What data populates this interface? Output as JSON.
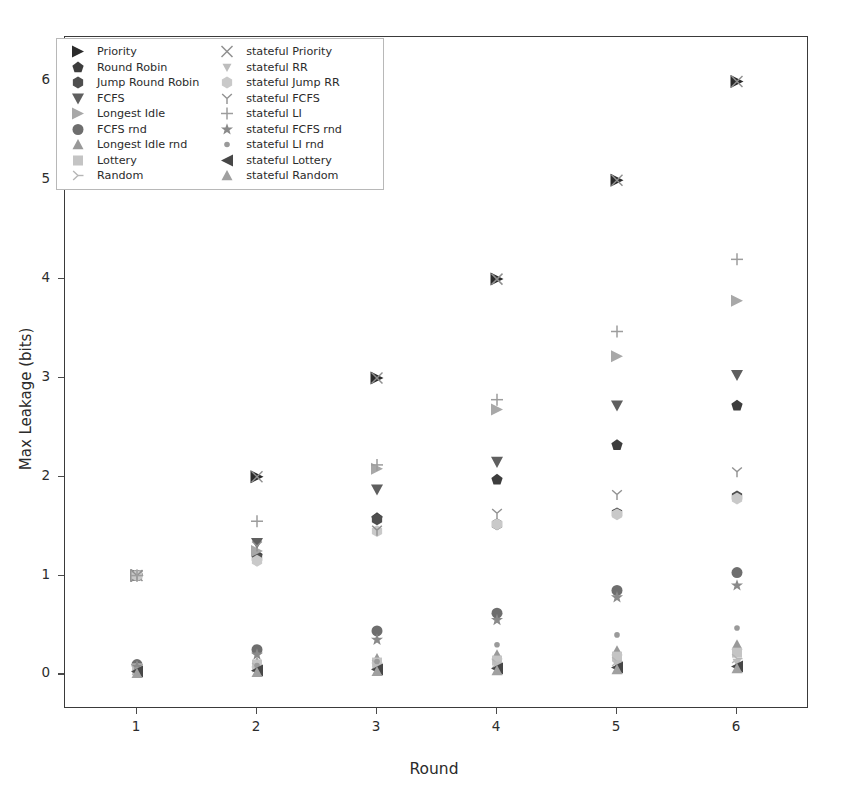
{
  "chart_data": {
    "type": "scatter",
    "title": "",
    "xlabel": "Round",
    "ylabel": "Max Leakage (bits)",
    "xlim": [
      0.4,
      6.6
    ],
    "ylim": [
      -0.35,
      6.45
    ],
    "xticks": [
      "1",
      "2",
      "3",
      "4",
      "5",
      "6"
    ],
    "yticks": [
      "0",
      "1",
      "2",
      "3",
      "4",
      "5",
      "6"
    ],
    "grid": false,
    "legend_position": "upper left",
    "x": [
      1,
      2,
      3,
      4,
      5,
      6
    ],
    "series": [
      {
        "name": "Priority",
        "marker": "triangle-right",
        "color": "#2b2b2b",
        "size": 13,
        "values": [
          1.0,
          2.0,
          3.0,
          4.0,
          5.0,
          6.0
        ]
      },
      {
        "name": "Round Robin",
        "marker": "pentagon",
        "color": "#3d3d3d",
        "size": 11,
        "values": [
          1.0,
          1.2,
          1.58,
          1.97,
          2.32,
          2.72
        ]
      },
      {
        "name": "Jump Round Robin",
        "marker": "hexagon",
        "color": "#4f4f4f",
        "size": 11,
        "values": [
          1.0,
          1.18,
          1.57,
          1.52,
          1.63,
          1.8
        ]
      },
      {
        "name": "FCFS",
        "marker": "triangle-down",
        "color": "#5f5f5f",
        "size": 12,
        "values": [
          1.0,
          1.33,
          1.87,
          2.15,
          2.72,
          3.03
        ]
      },
      {
        "name": "Longest Idle",
        "marker": "triangle-right-light",
        "color": "#a8a8a8",
        "size": 12,
        "values": [
          1.0,
          1.25,
          2.08,
          2.68,
          3.22,
          3.78
        ]
      },
      {
        "name": "FCFS rnd",
        "marker": "circle",
        "color": "#6e6e6e",
        "size": 11,
        "values": [
          0.1,
          0.25,
          0.44,
          0.62,
          0.85,
          1.03
        ]
      },
      {
        "name": "Longest Idle rnd",
        "marker": "triangle-up",
        "color": "#999999",
        "size": 11,
        "values": [
          0.08,
          0.12,
          0.16,
          0.2,
          0.24,
          0.3
        ]
      },
      {
        "name": "Lottery",
        "marker": "square",
        "color": "#c4c4c4",
        "size": 10,
        "values": [
          0.06,
          0.1,
          0.12,
          0.14,
          0.18,
          0.22
        ]
      },
      {
        "name": "Random",
        "marker": "tri-right",
        "color": "#b5b5b5",
        "size": 11,
        "values": [
          0.04,
          0.07,
          0.1,
          0.11,
          0.13,
          0.16
        ]
      },
      {
        "name": "stateful Priority",
        "marker": "x",
        "color": "#8f8f8f",
        "size": 11,
        "values": [
          1.0,
          2.0,
          3.0,
          4.0,
          5.0,
          6.0
        ]
      },
      {
        "name": "stateful RR",
        "marker": "tri-down-small",
        "color": "#bdbdbd",
        "size": 9,
        "values": [
          0.02,
          0.05,
          0.07,
          0.09,
          0.1,
          0.12
        ]
      },
      {
        "name": "stateful Jump RR",
        "marker": "hexagon-light",
        "color": "#c9c9c9",
        "size": 11,
        "values": [
          1.0,
          1.15,
          1.45,
          1.52,
          1.62,
          1.78
        ]
      },
      {
        "name": "stateful FCFS",
        "marker": "y-glyph",
        "color": "#909090",
        "size": 11,
        "values": [
          1.0,
          1.3,
          1.46,
          1.63,
          1.82,
          2.05
        ]
      },
      {
        "name": "stateful LI",
        "marker": "plus",
        "color": "#9d9d9d",
        "size": 12,
        "values": [
          1.0,
          1.55,
          2.12,
          2.78,
          3.47,
          4.2
        ]
      },
      {
        "name": "stateful FCFS rnd",
        "marker": "star",
        "color": "#8a8a8a",
        "size": 11,
        "values": [
          0.08,
          0.2,
          0.35,
          0.55,
          0.78,
          0.9
        ]
      },
      {
        "name": "stateful LI rnd",
        "marker": "dot",
        "color": "#9a9a9a",
        "size": 7,
        "values": [
          0.05,
          0.09,
          0.13,
          0.3,
          0.4,
          0.47
        ]
      },
      {
        "name": "stateful Lottery",
        "marker": "triangle-left",
        "color": "#474747",
        "size": 12,
        "values": [
          0.03,
          0.04,
          0.05,
          0.06,
          0.07,
          0.08
        ]
      },
      {
        "name": "stateful Random",
        "marker": "tri-up-thin",
        "color": "#a0a0a0",
        "size": 11,
        "values": [
          0.01,
          0.02,
          0.03,
          0.04,
          0.05,
          0.06
        ]
      }
    ]
  },
  "axes": {
    "xlabel": "Round",
    "ylabel": "Max Leakage (bits)",
    "xticks": [
      "1",
      "2",
      "3",
      "4",
      "5",
      "6"
    ],
    "yticks": [
      "0",
      "1",
      "2",
      "3",
      "4",
      "5",
      "6"
    ]
  },
  "legend": {
    "left_column": [
      {
        "label": "Priority",
        "icon": "triangle-right-marker"
      },
      {
        "label": "Round Robin",
        "icon": "pentagon-marker"
      },
      {
        "label": "Jump Round Robin",
        "icon": "hexagon-marker"
      },
      {
        "label": "FCFS",
        "icon": "triangle-down-marker"
      },
      {
        "label": "Longest Idle",
        "icon": "triangle-right-light-marker"
      },
      {
        "label": "FCFS rnd",
        "icon": "circle-marker"
      },
      {
        "label": "Longest Idle rnd",
        "icon": "triangle-up-marker"
      },
      {
        "label": "Lottery",
        "icon": "square-marker"
      },
      {
        "label": "Random",
        "icon": "tri-right-marker"
      }
    ],
    "right_column": [
      {
        "label": "stateful Priority",
        "icon": "x-marker"
      },
      {
        "label": "stateful RR",
        "icon": "tri-down-small-marker"
      },
      {
        "label": "stateful Jump RR",
        "icon": "hexagon-light-marker"
      },
      {
        "label": "stateful FCFS",
        "icon": "y-glyph-marker"
      },
      {
        "label": "stateful LI",
        "icon": "plus-marker"
      },
      {
        "label": "stateful FCFS rnd",
        "icon": "star-marker"
      },
      {
        "label": "stateful LI rnd",
        "icon": "dot-marker"
      },
      {
        "label": "stateful Lottery",
        "icon": "triangle-left-marker"
      },
      {
        "label": "stateful Random",
        "icon": "tri-up-thin-marker"
      }
    ]
  }
}
